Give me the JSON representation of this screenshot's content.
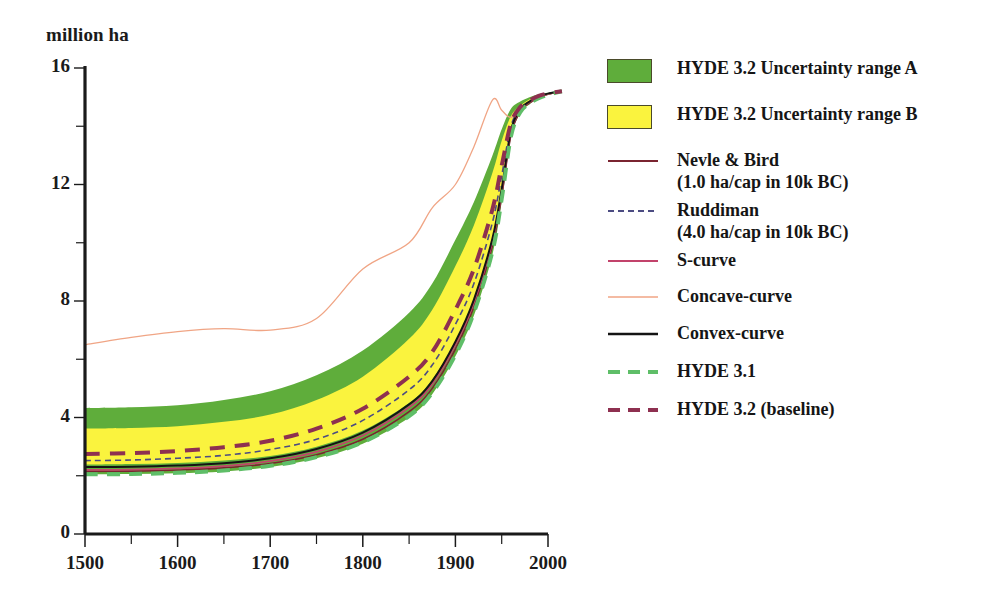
{
  "chart_data": {
    "type": "line",
    "title": "",
    "xlabel": "",
    "ylabel": "million ha",
    "xlim": [
      1500,
      2015
    ],
    "ylim": [
      0,
      16
    ],
    "xticks": [
      1500,
      1600,
      1700,
      1800,
      1900,
      2000
    ],
    "xticklabels": [
      "1500",
      "1600",
      "1700",
      "1800",
      "1900",
      "2000"
    ],
    "xminorticks": [
      1550,
      1650,
      1750,
      1850,
      1950
    ],
    "yticks": [
      0,
      4,
      8,
      12,
      16
    ],
    "yticklabels": [
      "0",
      "4",
      "8",
      "12",
      "16"
    ],
    "yminorticks": [
      2,
      6,
      10,
      14
    ],
    "grid": false,
    "legend_position": "right",
    "x": [
      1500,
      1550,
      1600,
      1650,
      1700,
      1750,
      1800,
      1850,
      1875,
      1900,
      1920,
      1940,
      1950,
      1960,
      1970,
      1980,
      1990,
      2000,
      2015
    ],
    "bands": [
      {
        "name": "HYDE 3.2 Uncertainty range A",
        "color": "#5FAD3B",
        "upper": [
          4.32,
          4.35,
          4.42,
          4.6,
          4.9,
          5.45,
          6.3,
          7.6,
          8.6,
          10.1,
          11.4,
          13.0,
          13.9,
          14.6,
          14.85,
          15.0,
          15.1,
          15.15,
          15.2
        ],
        "lower": [
          2.05,
          2.06,
          2.09,
          2.15,
          2.3,
          2.6,
          3.1,
          4.0,
          4.8,
          6.1,
          7.5,
          9.6,
          11.4,
          13.6,
          14.45,
          14.75,
          14.95,
          15.08,
          15.2
        ]
      },
      {
        "name": "HYDE 3.2 Uncertainty range B",
        "color": "#FAF33E",
        "upper": [
          3.62,
          3.64,
          3.7,
          3.85,
          4.1,
          4.6,
          5.4,
          6.7,
          7.7,
          9.2,
          10.6,
          12.4,
          13.5,
          14.35,
          14.7,
          14.92,
          15.06,
          15.13,
          15.2
        ],
        "lower": [
          2.38,
          2.4,
          2.44,
          2.52,
          2.68,
          3.0,
          3.55,
          4.5,
          5.3,
          6.6,
          8.0,
          10.1,
          11.8,
          13.8,
          14.55,
          14.82,
          15.0,
          15.1,
          15.2
        ]
      }
    ],
    "series": [
      {
        "name": "Nevle & Bird",
        "sublabel": "(1.0 ha/cap in 10k BC)",
        "color": "#7A2430",
        "style": "solid",
        "width": 1.6,
        "values": [
          2.15,
          2.16,
          2.2,
          2.27,
          2.42,
          2.72,
          3.25,
          4.2,
          5.0,
          6.35,
          7.8,
          9.9,
          11.6,
          13.7,
          14.5,
          14.8,
          14.98,
          15.1,
          15.2
        ]
      },
      {
        "name": "Ruddiman",
        "sublabel": "(4.0 ha/cap in 10k BC)",
        "color": "#4C4C82",
        "style": "dashed",
        "width": 1.6,
        "values": [
          2.52,
          2.54,
          2.6,
          2.7,
          2.9,
          3.25,
          3.9,
          4.95,
          5.8,
          7.2,
          8.6,
          10.7,
          12.3,
          14.0,
          14.6,
          14.85,
          15.02,
          15.12,
          15.2
        ]
      },
      {
        "name": "S-curve",
        "color": "#C2436B",
        "style": "solid",
        "width": 1.8,
        "values": [
          2.2,
          2.21,
          2.25,
          2.33,
          2.5,
          2.82,
          3.38,
          4.35,
          5.15,
          6.5,
          7.95,
          10.05,
          11.75,
          13.8,
          14.55,
          14.83,
          15.0,
          15.11,
          15.2
        ]
      },
      {
        "name": "Concave-curve",
        "color": "#F0A585",
        "style": "solid",
        "width": 1.3,
        "values": [
          6.5,
          6.75,
          6.95,
          7.05,
          7.0,
          7.4,
          9.1,
          10.0,
          11.2,
          12.0,
          13.3,
          14.9,
          14.55,
          14.3,
          14.6,
          14.85,
          15.0,
          15.1,
          15.2
        ]
      },
      {
        "name": "Convex-curve",
        "color": "#141414",
        "style": "solid",
        "width": 2.0,
        "values": [
          2.3,
          2.31,
          2.35,
          2.43,
          2.6,
          2.92,
          3.48,
          4.45,
          5.25,
          6.6,
          8.05,
          10.15,
          11.85,
          13.85,
          14.58,
          14.85,
          15.02,
          15.12,
          15.2
        ]
      },
      {
        "name": "HYDE 3.1",
        "color": "#5FBE68",
        "style": "dashed",
        "width": 4.0,
        "values": [
          2.05,
          2.06,
          2.1,
          2.18,
          2.34,
          2.64,
          3.15,
          4.05,
          4.85,
          6.15,
          7.6,
          9.7,
          11.5,
          13.65,
          14.48,
          14.78,
          14.96,
          15.08,
          15.2
        ]
      },
      {
        "name": "HYDE 3.2 (baseline)",
        "color": "#8E3050",
        "style": "dashed",
        "width": 4.0,
        "values": [
          2.75,
          2.78,
          2.85,
          2.98,
          3.2,
          3.62,
          4.3,
          5.4,
          6.25,
          7.7,
          9.1,
          11.15,
          12.65,
          14.1,
          14.66,
          14.88,
          15.04,
          15.13,
          15.2
        ]
      }
    ]
  },
  "axis": {
    "unit_label": "million ha",
    "y_labels": [
      "16",
      "12",
      "8",
      "4",
      "0"
    ],
    "x_labels": [
      "1500",
      "1600",
      "1700",
      "1800",
      "1900",
      "2000"
    ]
  },
  "legend": {
    "items": [
      {
        "key": "swatch",
        "color": "#5FAD3B",
        "label": "HYDE 3.2 Uncertainty range A"
      },
      {
        "key": "swatch",
        "color": "#FAF33E",
        "label": "HYDE 3.2 Uncertainty range B"
      },
      {
        "key": "line",
        "color": "#7A2430",
        "style": "solid",
        "width": 1.8,
        "label": "Nevle & Bird\n(1.0 ha/cap in 10k BC)"
      },
      {
        "key": "line",
        "color": "#4C4C82",
        "style": "dashed",
        "width": 1.8,
        "label": "Ruddiman\n(4.0 ha/cap in 10k BC)"
      },
      {
        "key": "line",
        "color": "#C2436B",
        "style": "solid",
        "width": 2.0,
        "label": "S-curve"
      },
      {
        "key": "line",
        "color": "#F0A585",
        "style": "solid",
        "width": 1.4,
        "label": "Concave-curve"
      },
      {
        "key": "line",
        "color": "#141414",
        "style": "solid",
        "width": 2.4,
        "label": "Convex-curve"
      },
      {
        "key": "line",
        "color": "#5FBE68",
        "style": "dashed",
        "width": 4.0,
        "label": "HYDE 3.1"
      },
      {
        "key": "line",
        "color": "#8E3050",
        "style": "dashed",
        "width": 4.0,
        "label": "HYDE 3.2 (baseline)"
      }
    ]
  }
}
